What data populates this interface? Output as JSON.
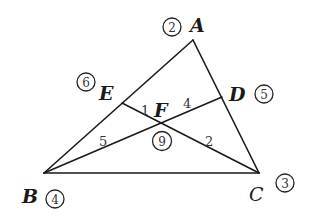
{
  "diagram": {
    "type": "triangle-with-cevians",
    "line_color": "#1a1a1a",
    "points": {
      "A": {
        "label": "A",
        "circled": "2"
      },
      "B": {
        "label": "B",
        "circled": "4"
      },
      "C": {
        "label": "C",
        "circled": "3"
      },
      "D": {
        "label": "D",
        "circled": "5"
      },
      "E": {
        "label": "E",
        "circled": "6"
      },
      "F": {
        "label": "F",
        "circled": "9"
      }
    },
    "segments": [
      "AB",
      "AC",
      "BC",
      "BD",
      "CE"
    ],
    "angle_labels": {
      "a1": "1",
      "a2": "2",
      "a4": "4",
      "a5": "5"
    }
  }
}
